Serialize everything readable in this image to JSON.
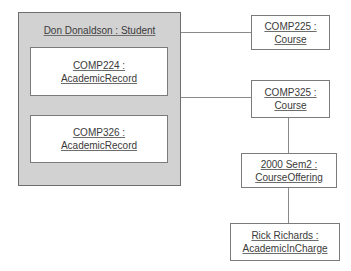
{
  "diagram": {
    "type": "uml-object-diagram",
    "objects": [
      {
        "id": "student",
        "name": "Don Donaldson",
        "class": "Student",
        "label": "Don Donaldson : Student",
        "style": "composite-gray-container"
      },
      {
        "id": "record224",
        "name": "COMP224",
        "class": "AcademicRecord",
        "line1": "COMP224 :",
        "line2": "AcademicRecord",
        "parent": "student"
      },
      {
        "id": "record326",
        "name": "COMP326",
        "class": "AcademicRecord",
        "line1": "COMP326 :",
        "line2": "AcademicRecord",
        "parent": "student"
      },
      {
        "id": "course225",
        "name": "COMP225",
        "class": "Course",
        "line1": "COMP225 :",
        "line2": "Course"
      },
      {
        "id": "course325",
        "name": "COMP325",
        "class": "Course",
        "line1": "COMP325 :",
        "line2": "Course"
      },
      {
        "id": "offering",
        "name": "2000 Sem2",
        "class": "CourseOffering",
        "line1": "2000 Sem2 :",
        "line2": "CourseOffering"
      },
      {
        "id": "incharge",
        "name": "Rick Richards",
        "class": "AcademicInCharge",
        "line1": "Rick Richards :",
        "line2": "AcademicInCharge"
      }
    ],
    "links": [
      {
        "id": "link-student-course225",
        "from": "student",
        "to": "course225"
      },
      {
        "id": "link-student-course325",
        "from": "student",
        "to": "course325"
      },
      {
        "id": "link-course325-offering",
        "from": "course325",
        "to": "offering"
      },
      {
        "id": "link-offering-incharge",
        "from": "offering",
        "to": "incharge"
      }
    ],
    "colors": {
      "container_fill": "#d2d2d2",
      "box_fill": "#ffffff",
      "border": "#7b7b7b",
      "text": "#3a3a3a",
      "link": "#8a8a8a",
      "background": "#ffffff"
    }
  }
}
